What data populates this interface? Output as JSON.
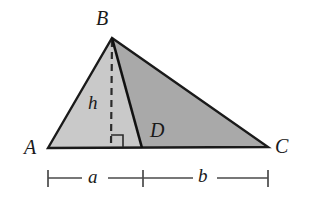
{
  "figure": {
    "kind": "geometry-diagram",
    "background_color": "#ffffff",
    "stroke_color": "#1a1a1a",
    "fill_left_color": "#c9c9c9",
    "fill_right_color": "#a9a9a9",
    "dimension_color": "#4a4a4a",
    "vertices": {
      "A": {
        "label": "A",
        "x": 48,
        "y": 148
      },
      "B": {
        "label": "B",
        "x": 112,
        "y": 38
      },
      "C": {
        "label": "C",
        "x": 268,
        "y": 147
      },
      "D": {
        "label": "D",
        "x": 142,
        "y": 147
      },
      "H": {
        "label": "",
        "x": 111,
        "y": 147
      }
    },
    "labels": {
      "A": "A",
      "B": "B",
      "C": "C",
      "D": "D",
      "height": "h",
      "segment_a": "a",
      "segment_b": "b"
    },
    "segments": {
      "altitude_style": "dashed",
      "cevian_style": "solid",
      "right_angle_marker": true
    },
    "dimension_line": {
      "start_x": 48,
      "tick_x": 143,
      "end_x": 268,
      "y": 178,
      "left_label": "a",
      "right_label": "b"
    }
  }
}
